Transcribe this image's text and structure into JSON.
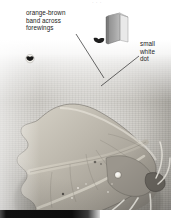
{
  "page": {
    "width": 171,
    "height": 218,
    "kind": "field-guide-plate"
  },
  "top_clip": {
    "text": "·  ·  ·"
  },
  "callouts": [
    {
      "id": "orange-brown-band",
      "text": "orange-brown\nband across\nforewings",
      "position": "upper-left",
      "leader_to": "forewing-band"
    },
    {
      "id": "small-white-dot",
      "text": "small\nwhite\ndot",
      "position": "upper-right",
      "leader_to": "white-dot-on-wing"
    }
  ],
  "icons": {
    "book": "field-guide-book-icon",
    "life_size_guide": "moth-silhouette-icon",
    "life_size_scale": "moth-silhouette-scale-icon"
  },
  "photo": {
    "subject": "moth",
    "description": "grey-scale photograph of a moth at rest with angular scalloped forewings, showing a band across the forewings and a small white dot",
    "background": "#b4b1aa"
  },
  "markers": {
    "white_dot_label": "small white dot",
    "band_label": "orange-brown band across forewings"
  },
  "bottom_bar": {
    "text": ""
  },
  "colors": {
    "paper": "#ffffff",
    "photo_mid": "#b4b1aa",
    "photo_dark": "#7e7b77",
    "text": "#1b1b1b",
    "bar": "#0d0d0d",
    "moth_light": "#d6d2c7",
    "moth_mid": "#a9a49a",
    "moth_dark": "#6e6a63",
    "white_dot": "#f7f5ef"
  }
}
